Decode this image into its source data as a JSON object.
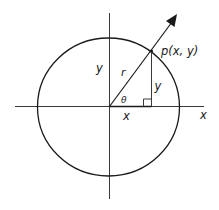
{
  "diagram": {
    "colors": {
      "stroke": "#1a1a1a",
      "axis": "#3a3a3a",
      "background": "#ffffff"
    },
    "labels": {
      "point": "p(x, y)",
      "x_axis": "x",
      "y_axis": "y",
      "radius": "r",
      "angle": "θ",
      "x_component": "x",
      "y_component": "y"
    }
  }
}
